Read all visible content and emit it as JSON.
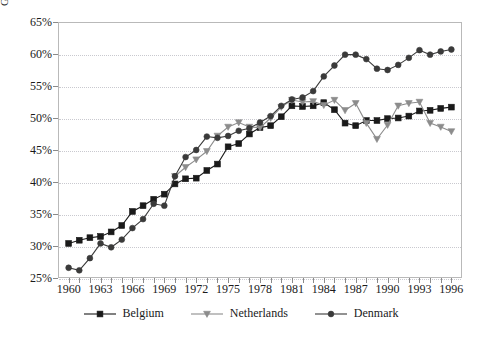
{
  "chart_data": {
    "type": "line",
    "title": "",
    "xlabel": "",
    "ylabel": "General Gov't Revenues/GDP",
    "xlim": [
      1959,
      1997
    ],
    "ylim": [
      25,
      65
    ],
    "ytick_step": 5,
    "xtick_step": 3,
    "grid": true,
    "legend_position": "bottom",
    "ytick_labels": [
      "25%",
      "30%",
      "35%",
      "40%",
      "45%",
      "50%",
      "55%",
      "60%",
      "65%"
    ],
    "ytick_values": [
      25,
      30,
      35,
      40,
      45,
      50,
      55,
      60,
      65
    ],
    "xtick_labels": [
      "1960",
      "1963",
      "1966",
      "1969",
      "1972",
      "1975",
      "1978",
      "1981",
      "1984",
      "1987",
      "1990",
      "1993",
      "1996"
    ],
    "xtick_values": [
      1960,
      1963,
      1966,
      1969,
      1972,
      1975,
      1978,
      1981,
      1984,
      1987,
      1990,
      1993,
      1996
    ],
    "x": [
      1960,
      1961,
      1962,
      1963,
      1964,
      1965,
      1966,
      1967,
      1968,
      1969,
      1970,
      1971,
      1972,
      1973,
      1974,
      1975,
      1976,
      1977,
      1978,
      1979,
      1980,
      1981,
      1982,
      1983,
      1984,
      1985,
      1986,
      1987,
      1988,
      1989,
      1990,
      1991,
      1992,
      1993,
      1994,
      1995,
      1996
    ],
    "series": [
      {
        "name": "Belgium",
        "color": "#1a1a1a",
        "marker": "square",
        "values": [
          30.4,
          30.9,
          31.3,
          31.5,
          32.2,
          33.2,
          35.4,
          36.3,
          37.3,
          38.1,
          39.7,
          40.5,
          40.6,
          41.8,
          42.8,
          45.5,
          46.0,
          47.5,
          48.5,
          48.8,
          50.2,
          51.9,
          51.8,
          51.9,
          52.4,
          51.3,
          49.2,
          48.8,
          49.6,
          49.6,
          49.9,
          50.0,
          50.3,
          51.1,
          51.2,
          51.5,
          51.7
        ]
      },
      {
        "name": "Netherlands",
        "color": "#8c8c8c",
        "marker": "triangle",
        "values": [
          null,
          null,
          null,
          null,
          null,
          null,
          null,
          null,
          null,
          null,
          40.9,
          42.3,
          43.5,
          44.8,
          47.2,
          48.6,
          49.3,
          48.6,
          48.5,
          50.0,
          51.7,
          52.8,
          52.5,
          52.6,
          52.0,
          52.8,
          51.2,
          52.3,
          49.2,
          46.7,
          48.9,
          51.9,
          52.3,
          52.5,
          49.2,
          48.6,
          47.9
        ]
      },
      {
        "name": "Denmark",
        "color": "#3a3a3a",
        "marker": "circle",
        "values": [
          26.6,
          26.2,
          28.1,
          30.4,
          29.8,
          31.0,
          32.8,
          34.2,
          36.6,
          36.3,
          40.9,
          43.9,
          45.0,
          47.1,
          46.9,
          47.2,
          48.0,
          48.4,
          49.3,
          50.3,
          51.9,
          52.9,
          53.2,
          54.2,
          56.5,
          58.2,
          59.9,
          59.9,
          59.2,
          57.7,
          57.5,
          58.3,
          59.4,
          60.6,
          59.9,
          60.4,
          60.7
        ]
      }
    ]
  },
  "legend": {
    "items": [
      {
        "label": "Belgium"
      },
      {
        "label": "Netherlands"
      },
      {
        "label": "Denmark"
      }
    ]
  }
}
